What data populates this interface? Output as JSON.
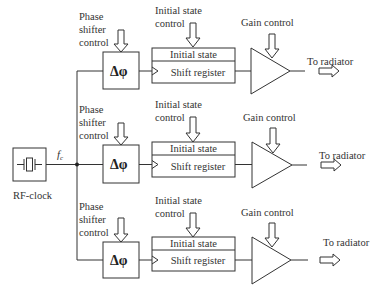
{
  "diagram": {
    "clock": {
      "label": "RF-clock",
      "signal_label": "f",
      "signal_subscript": "c",
      "icon": "crystal-oscillator-icon"
    },
    "channels": [
      {
        "phase_shifter": {
          "control_label": [
            "Phase",
            "shifter",
            "control"
          ],
          "symbol": "Δφ"
        },
        "register": {
          "control_label": [
            "Initial state",
            "control"
          ],
          "top_label": "Initial state",
          "bottom_label": "Shift register"
        },
        "amplifier": {
          "control_label": "Gain control"
        },
        "output_label": "To radiator"
      },
      {
        "phase_shifter": {
          "control_label": [
            "Phase",
            "shifter",
            "control"
          ],
          "symbol": "Δφ"
        },
        "register": {
          "control_label": [
            "Initial state",
            "control"
          ],
          "top_label": "Initial state",
          "bottom_label": "Shift register"
        },
        "amplifier": {
          "control_label": "Gain control"
        },
        "output_label": "To radiator"
      },
      {
        "phase_shifter": {
          "control_label": [
            "Phase",
            "shifter",
            "control"
          ],
          "symbol": "Δφ"
        },
        "register": {
          "control_label": [
            "Initial state",
            "control"
          ],
          "top_label": "Initial state",
          "bottom_label": "Shift register"
        },
        "amplifier": {
          "control_label": "Gain control"
        },
        "output_label": "To radiator"
      }
    ],
    "colors": {
      "line": "#333333",
      "text": "#333333",
      "background": "#ffffff"
    }
  }
}
